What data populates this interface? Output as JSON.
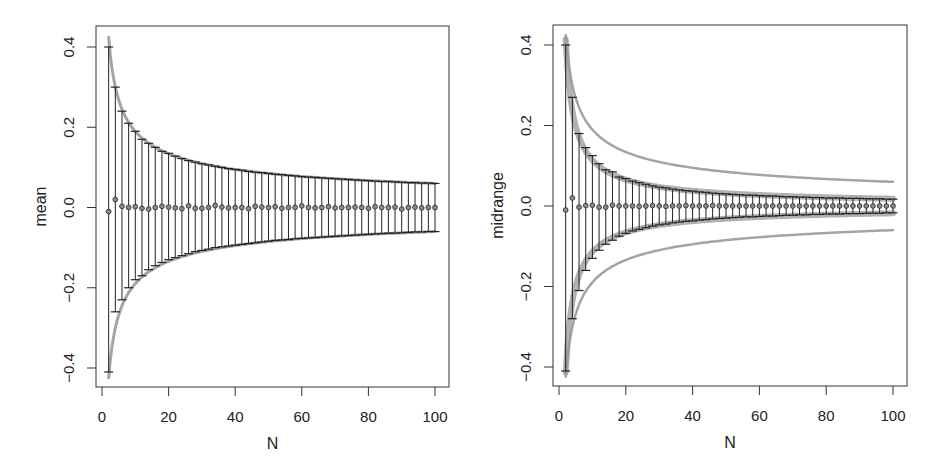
{
  "figure": {
    "width": 949,
    "height": 476,
    "colors": {
      "axis": "#333333",
      "errorbar": "#222222",
      "point_fill": "#8a8a8a",
      "point_stroke": "#333333",
      "envelope": "#9a9a9a",
      "band": "#a8a8a8"
    }
  },
  "chart_data": [
    {
      "type": "errorbar",
      "title": "",
      "xlabel": "N",
      "ylabel": "mean",
      "xlim": [
        0,
        100
      ],
      "ylim": [
        -0.45,
        0.45
      ],
      "xticks": [
        0,
        20,
        40,
        60,
        80,
        100
      ],
      "xtick_labels": [
        "0",
        "20",
        "40",
        "60",
        "80",
        "100"
      ],
      "yticks": [
        -0.4,
        -0.2,
        0.0,
        0.2,
        0.4
      ],
      "ytick_labels": [
        "-0.4",
        "-0.2",
        "0.0",
        "0.2",
        "0.4"
      ],
      "grid": false,
      "box": {
        "left": 96,
        "top": 26,
        "right": 449,
        "bottom": 387
      },
      "x_px": {
        "0": 102,
        "100": 435
      },
      "y_px": {
        "0.4": 47,
        "-0.4": 368
      },
      "N": [
        2,
        4,
        6,
        8,
        10,
        12,
        14,
        16,
        18,
        20,
        22,
        24,
        26,
        28,
        30,
        32,
        34,
        36,
        38,
        40,
        42,
        44,
        46,
        48,
        50,
        52,
        54,
        56,
        58,
        60,
        62,
        64,
        66,
        68,
        70,
        72,
        74,
        76,
        78,
        80,
        82,
        84,
        86,
        88,
        90,
        92,
        94,
        96,
        98,
        100
      ],
      "center": [
        -0.01,
        0.02,
        0.003,
        0.0,
        0.002,
        -0.002,
        -0.004,
        0.0,
        0.003,
        0.001,
        -0.001,
        -0.003,
        0.004,
        -0.002,
        -0.002,
        0.0,
        0.005,
        0.001,
        -0.001,
        0.0,
        0.0,
        -0.003,
        0.003,
        0.001,
        0.0,
        0.002,
        -0.002,
        0.0,
        0.0,
        0.004,
        0.0,
        -0.001,
        0.0,
        0.002,
        -0.001,
        0.0,
        0.0,
        0.001,
        0.0,
        -0.002,
        0.002,
        0.0,
        0.0,
        0.001,
        -0.004,
        0.0,
        0.001,
        -0.001,
        0.0,
        0.0
      ],
      "upper": [
        0.4,
        0.3,
        0.24,
        0.21,
        0.19,
        0.17,
        0.16,
        0.15,
        0.14,
        0.135,
        0.128,
        0.122,
        0.117,
        0.113,
        0.109,
        0.106,
        0.103,
        0.1,
        0.097,
        0.095,
        0.093,
        0.09,
        0.088,
        0.087,
        0.085,
        0.083,
        0.082,
        0.08,
        0.079,
        0.077,
        0.076,
        0.075,
        0.074,
        0.073,
        0.072,
        0.071,
        0.07,
        0.069,
        0.068,
        0.067,
        0.066,
        0.065,
        0.065,
        0.064,
        0.063,
        0.062,
        0.062,
        0.061,
        0.061,
        0.06
      ],
      "lower": [
        -0.41,
        -0.26,
        -0.23,
        -0.2,
        -0.18,
        -0.17,
        -0.155,
        -0.145,
        -0.137,
        -0.13,
        -0.125,
        -0.12,
        -0.115,
        -0.11,
        -0.107,
        -0.104,
        -0.1,
        -0.098,
        -0.096,
        -0.094,
        -0.092,
        -0.09,
        -0.088,
        -0.086,
        -0.084,
        -0.082,
        -0.081,
        -0.08,
        -0.078,
        -0.077,
        -0.076,
        -0.075,
        -0.074,
        -0.073,
        -0.072,
        -0.071,
        -0.07,
        -0.069,
        -0.068,
        -0.067,
        -0.066,
        -0.065,
        -0.064,
        -0.064,
        -0.063,
        -0.062,
        -0.061,
        -0.061,
        -0.06,
        -0.06
      ],
      "envelopes": [
        {
          "name": "theoretical bound",
          "coef": 0.6,
          "power": -0.5,
          "width": 3
        }
      ]
    },
    {
      "type": "errorbar",
      "title": "",
      "xlabel": "N",
      "ylabel": "midrange",
      "xlim": [
        0,
        100
      ],
      "ylim": [
        -0.45,
        0.45
      ],
      "xticks": [
        0,
        20,
        40,
        60,
        80,
        100
      ],
      "xtick_labels": [
        "0",
        "20",
        "40",
        "60",
        "80",
        "100"
      ],
      "yticks": [
        -0.4,
        -0.2,
        0.0,
        0.2,
        0.4
      ],
      "ytick_labels": [
        "-0.4",
        "-0.2",
        "0.0",
        "0.2",
        "0.4"
      ],
      "grid": false,
      "box": {
        "left": 553,
        "top": 25,
        "right": 907,
        "bottom": 386
      },
      "x_px": {
        "0": 559,
        "100": 893
      },
      "y_px": {
        "0.4": 45,
        "-0.4": 367
      },
      "N": [
        2,
        4,
        6,
        8,
        10,
        12,
        14,
        16,
        18,
        20,
        22,
        24,
        26,
        28,
        30,
        32,
        34,
        36,
        38,
        40,
        42,
        44,
        46,
        48,
        50,
        52,
        54,
        56,
        58,
        60,
        62,
        64,
        66,
        68,
        70,
        72,
        74,
        76,
        78,
        80,
        82,
        84,
        86,
        88,
        90,
        92,
        94,
        96,
        98,
        100
      ],
      "center": [
        -0.01,
        0.02,
        -0.003,
        0.001,
        0.002,
        -0.003,
        -0.003,
        0.002,
        0.0,
        0.0,
        0.0,
        -0.001,
        0.0,
        0.001,
        0.0,
        -0.001,
        0.0,
        0.0,
        0.001,
        0.0,
        0.0,
        0.0,
        0.001,
        0.0,
        0.0,
        0.0,
        0.0,
        0.0,
        0.0,
        0.0,
        0.0,
        0.0,
        0.0,
        0.0,
        0.0,
        0.0,
        0.0,
        0.0,
        0.0,
        0.0,
        0.0,
        0.0,
        0.0,
        0.0,
        0.0,
        0.0,
        0.0,
        0.0,
        0.0,
        0.0
      ],
      "upper": [
        0.4,
        0.27,
        0.18,
        0.145,
        0.125,
        0.105,
        0.09,
        0.085,
        0.072,
        0.068,
        0.062,
        0.058,
        0.054,
        0.05,
        0.047,
        0.045,
        0.042,
        0.04,
        0.038,
        0.037,
        0.035,
        0.034,
        0.032,
        0.031,
        0.03,
        0.029,
        0.028,
        0.027,
        0.027,
        0.026,
        0.025,
        0.025,
        0.024,
        0.023,
        0.023,
        0.022,
        0.022,
        0.021,
        0.021,
        0.02,
        0.02,
        0.02,
        0.019,
        0.019,
        0.019,
        0.018,
        0.018,
        0.018,
        0.017,
        0.017
      ],
      "lower": [
        -0.41,
        -0.28,
        -0.21,
        -0.16,
        -0.13,
        -0.11,
        -0.095,
        -0.085,
        -0.075,
        -0.068,
        -0.062,
        -0.058,
        -0.054,
        -0.05,
        -0.047,
        -0.045,
        -0.042,
        -0.04,
        -0.038,
        -0.037,
        -0.035,
        -0.034,
        -0.032,
        -0.031,
        -0.03,
        -0.029,
        -0.028,
        -0.027,
        -0.027,
        -0.026,
        -0.025,
        -0.025,
        -0.024,
        -0.023,
        -0.023,
        -0.022,
        -0.022,
        -0.021,
        -0.021,
        -0.02,
        -0.02,
        -0.02,
        -0.019,
        -0.019,
        -0.019,
        -0.018,
        -0.018,
        -0.018,
        -0.017,
        -0.017
      ],
      "envelopes": [
        {
          "name": "midrange bound (thick band)",
          "coef": 0.72,
          "power": -0.8,
          "width": 6
        },
        {
          "name": "mean bound (thin reference)",
          "coef": 0.6,
          "power": -0.5,
          "width": 2.5
        }
      ]
    }
  ]
}
